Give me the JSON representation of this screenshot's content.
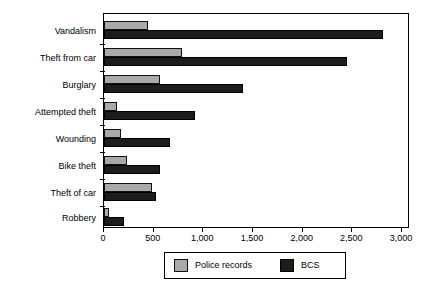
{
  "chart_data": {
    "type": "bar",
    "orientation": "horizontal",
    "title": "",
    "xlabel": "",
    "ylabel": "",
    "xlim": [
      0,
      3000
    ],
    "grid": false,
    "legend_position": "bottom",
    "categories": [
      "Vandalism",
      "Theft from car",
      "Burglary",
      "Attempted theft",
      "Wounding",
      "Bike theft",
      "Theft of car",
      "Robbery"
    ],
    "xticks": [
      0,
      500,
      1000,
      1500,
      2000,
      2500,
      3000
    ],
    "xtick_labels": [
      "0",
      "500",
      "1,000",
      "1,500",
      "2,000",
      "2,500",
      "3,000"
    ],
    "series": [
      {
        "name": "Police records",
        "color": "#a9a9a9",
        "values": [
          440,
          790,
          565,
          130,
          170,
          230,
          485,
          50
        ]
      },
      {
        "name": "BCS",
        "color": "#1c1c1c",
        "values": [
          2810,
          2450,
          1400,
          915,
          665,
          565,
          525,
          200
        ]
      }
    ]
  },
  "legend": {
    "items": [
      {
        "label": "Police records",
        "swatch": "police-swatch"
      },
      {
        "label": "BCS",
        "swatch": "bcs-swatch"
      }
    ]
  }
}
